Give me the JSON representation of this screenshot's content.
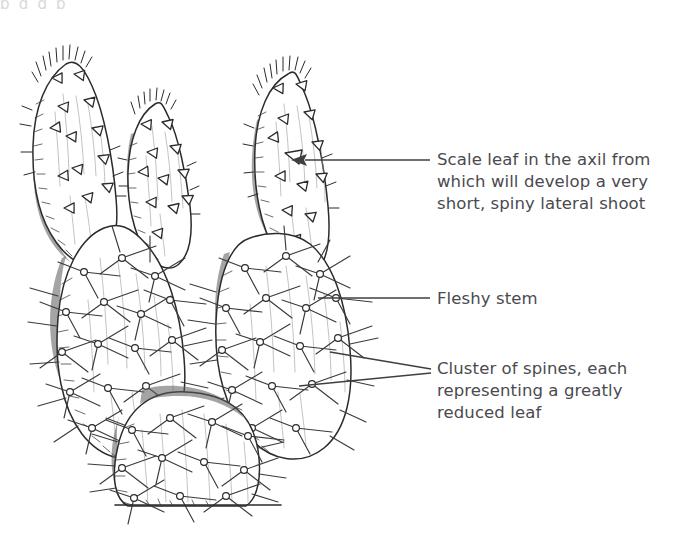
{
  "figure": {
    "cropped_caption_remnant": "p     g       g                 p",
    "background_color": "#ffffff",
    "ink_color": "#2b2b2b",
    "label_text_color": "#4a4a4f"
  },
  "annotations": [
    {
      "id": "scale-leaf",
      "text": "Scale leaf in the axil from which will develop a very short, spiny lateral shoot",
      "leader": "single-arrow",
      "points_to": "scale leaf on upper right pad"
    },
    {
      "id": "fleshy-stem",
      "text": "Fleshy stem",
      "leader": "single-line",
      "points_to": "large right cladode"
    },
    {
      "id": "spine-cluster",
      "text": "Cluster of spines, each representing a greatly reduced leaf",
      "leader": "double-line-wedge",
      "points_to": "areoles on lower pads"
    }
  ],
  "drawing": {
    "style": "pen-and-ink botanical line drawing",
    "pads": [
      {
        "name": "upper-left-pad",
        "type": "young cladode",
        "features": "scale leaves, apical bristles"
      },
      {
        "name": "upper-middle-pad",
        "type": "young cladode",
        "features": "scale leaves, apical bristles"
      },
      {
        "name": "upper-right-pad",
        "type": "young cladode",
        "features": "scale leaves, apical bristles"
      },
      {
        "name": "lower-left-pad",
        "type": "mature cladode",
        "features": "areoles with spine clusters"
      },
      {
        "name": "lower-right-pad",
        "type": "mature cladode",
        "features": "areoles with spine clusters"
      },
      {
        "name": "basal-pad",
        "type": "mature cladode",
        "features": "areoles with spine clusters"
      }
    ],
    "ground_line": true
  }
}
